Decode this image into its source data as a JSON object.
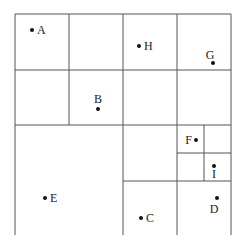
{
  "diagram": {
    "type": "quadtree-partition",
    "line_color": "#555555",
    "point_color": "#111111",
    "lines": [
      {
        "id": "outer-left",
        "x1": 15,
        "y1": 14,
        "x2": 15,
        "y2": 240
      },
      {
        "id": "outer-top",
        "x1": 15,
        "y1": 14,
        "x2": 231,
        "y2": 14
      },
      {
        "id": "outer-right",
        "x1": 231,
        "y1": 14,
        "x2": 231,
        "y2": 240
      },
      {
        "id": "v-69",
        "x1": 69,
        "y1": 14,
        "x2": 69,
        "y2": 125
      },
      {
        "id": "v-123",
        "x1": 123,
        "y1": 14,
        "x2": 123,
        "y2": 240
      },
      {
        "id": "v-177",
        "x1": 177,
        "y1": 14,
        "x2": 177,
        "y2": 240
      },
      {
        "id": "v-204",
        "x1": 204,
        "y1": 125,
        "x2": 204,
        "y2": 181
      },
      {
        "id": "h-70",
        "x1": 15,
        "y1": 70,
        "x2": 231,
        "y2": 70
      },
      {
        "id": "h-125",
        "x1": 15,
        "y1": 125,
        "x2": 231,
        "y2": 125
      },
      {
        "id": "h-153",
        "x1": 177,
        "y1": 153,
        "x2": 231,
        "y2": 153
      },
      {
        "id": "h-181",
        "x1": 123,
        "y1": 181,
        "x2": 231,
        "y2": 181
      }
    ],
    "points": [
      {
        "label": "A",
        "x": 32,
        "y": 30,
        "lx": 37,
        "ly": 34,
        "anchor": "start"
      },
      {
        "label": "B",
        "x": 98,
        "y": 109,
        "lx": 98,
        "ly": 103,
        "anchor": "middle"
      },
      {
        "label": "C",
        "x": 141,
        "y": 218,
        "lx": 146,
        "ly": 222,
        "anchor": "start"
      },
      {
        "label": "D",
        "x": 217,
        "y": 198,
        "lx": 214,
        "ly": 213,
        "anchor": "middle"
      },
      {
        "label": "E",
        "x": 45,
        "y": 198,
        "lx": 50,
        "ly": 202,
        "anchor": "start"
      },
      {
        "label": "F",
        "x": 196,
        "y": 140,
        "lx": 192,
        "ly": 144,
        "anchor": "end"
      },
      {
        "label": "G",
        "x": 213,
        "y": 63,
        "lx": 210,
        "ly": 59,
        "anchor": "middle"
      },
      {
        "label": "H",
        "x": 139,
        "y": 46,
        "lx": 144,
        "ly": 50,
        "anchor": "start"
      },
      {
        "label": "I",
        "x": 214,
        "y": 166,
        "lx": 214,
        "ly": 178,
        "anchor": "middle"
      }
    ]
  }
}
